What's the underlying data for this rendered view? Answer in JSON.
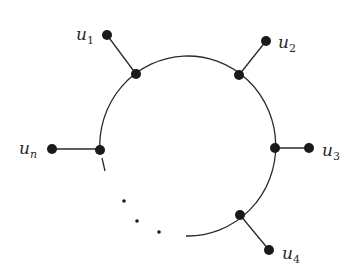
{
  "diagram": {
    "type": "graph",
    "colors": {
      "stroke": "#2a2a2a",
      "vertex": "#1a1a1a",
      "background": "#ffffff"
    },
    "labels": [
      {
        "id": "u1",
        "base": "u",
        "sub": "1"
      },
      {
        "id": "u2",
        "base": "u",
        "sub": "2"
      },
      {
        "id": "u3",
        "base": "u",
        "sub": "3"
      },
      {
        "id": "u4",
        "base": "u",
        "sub": "4"
      },
      {
        "id": "un",
        "base": "u",
        "sub": "n"
      }
    ],
    "ellipsis": "⋱"
  }
}
